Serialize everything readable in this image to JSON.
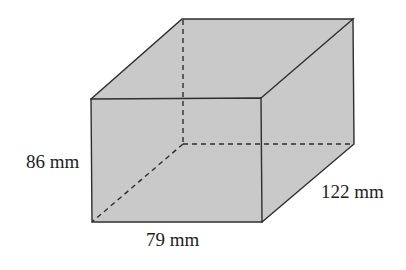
{
  "figure": {
    "type": "rectangular-prism",
    "colors": {
      "fill": "#c9c9c9",
      "edge": "#2e2e2e",
      "text": "#1e1e1e",
      "background": "#ffffff"
    },
    "labels": {
      "height": "86 mm",
      "width": "79 mm",
      "depth": "122 mm"
    },
    "dimensions": {
      "height_mm": 86,
      "width_mm": 79,
      "depth_mm": 122
    }
  }
}
